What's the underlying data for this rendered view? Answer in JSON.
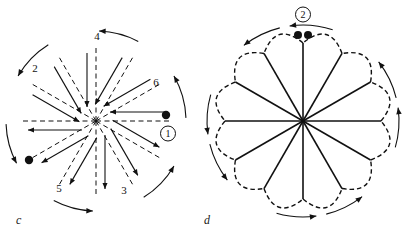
{
  "figure": {
    "panels": [
      {
        "id": "c",
        "label": "c",
        "label_x": 16,
        "label_y": 222,
        "center": {
          "x": 96,
          "y": 121
        },
        "radius": 74,
        "line_style": "dashed",
        "spoke_count": 12,
        "description": "star of twelve dashed radial lines with solid straight arrows alongside each spoke and curved arc arrows around the outside",
        "numeric_labels": [
          {
            "text": "2",
            "x": 35,
            "y": 72
          },
          {
            "text": "4",
            "x": 97,
            "y": 40
          },
          {
            "text": "6",
            "x": 156,
            "y": 86
          },
          {
            "text": "3",
            "x": 124,
            "y": 194
          },
          {
            "text": "5",
            "x": 59,
            "y": 192
          }
        ],
        "circled_labels": [
          {
            "text": "1",
            "x": 168,
            "y": 137
          }
        ],
        "dots": [
          {
            "x": 166,
            "y": 115,
            "r": 4.2,
            "name": "start-dot-right"
          },
          {
            "x": 29,
            "y": 160,
            "r": 4.2,
            "name": "end-dot-lower-left"
          }
        ],
        "spoke_angles_deg": [
          0,
          30,
          60,
          90,
          120,
          150,
          180,
          210,
          240,
          270,
          300,
          330
        ],
        "straight_arrows": [
          {
            "angle_deg": 0,
            "offset": 9,
            "direction": "inward"
          },
          {
            "angle_deg": 30,
            "offset": 9,
            "direction": "inward"
          },
          {
            "angle_deg": 60,
            "offset": 9,
            "direction": "inward"
          },
          {
            "angle_deg": 90,
            "offset": 9,
            "direction": "inward"
          },
          {
            "angle_deg": 120,
            "offset": 9,
            "direction": "inward"
          },
          {
            "angle_deg": 150,
            "offset": 9,
            "direction": "inward"
          },
          {
            "angle_deg": 180,
            "offset": 9,
            "direction": "outward"
          },
          {
            "angle_deg": 210,
            "offset": 9,
            "direction": "outward"
          },
          {
            "angle_deg": 240,
            "offset": 9,
            "direction": "outward"
          },
          {
            "angle_deg": 270,
            "offset": 9,
            "direction": "outward"
          },
          {
            "angle_deg": 300,
            "offset": 9,
            "direction": "outward"
          },
          {
            "angle_deg": 330,
            "offset": 9,
            "direction": "outward"
          }
        ],
        "arc_arrows": [
          {
            "from_deg": 62,
            "to_deg": 88,
            "r": 90,
            "head": "end"
          },
          {
            "from_deg": 122,
            "to_deg": 150,
            "r": 90,
            "head": "end"
          },
          {
            "from_deg": 182,
            "to_deg": 208,
            "r": 90,
            "head": "end"
          },
          {
            "from_deg": 242,
            "to_deg": 268,
            "r": 90,
            "head": "end"
          },
          {
            "from_deg": 302,
            "to_deg": 330,
            "r": 90,
            "head": "end"
          },
          {
            "from_deg": 2,
            "to_deg": 30,
            "r": 90,
            "head": "end"
          }
        ]
      },
      {
        "id": "d",
        "label": "d",
        "label_x": 204,
        "label_y": 222,
        "center": {
          "x": 303,
          "y": 121
        },
        "radius": 78,
        "line_style": "solid",
        "spoke_count": 12,
        "petal_count": 12,
        "petal_style": "dashed",
        "description": "rosette of twelve solid radial lines with twelve dashed petal arcs forming a flower outline and curved arrows around the rim",
        "numeric_labels": [],
        "circled_labels": [
          {
            "text": "2",
            "x": 303,
            "y": 18
          }
        ],
        "dots": [
          {
            "x": 298,
            "y": 35,
            "r": 4.0,
            "name": "pair-dot-left"
          },
          {
            "x": 308,
            "y": 35,
            "r": 4.0,
            "name": "pair-dot-right"
          }
        ],
        "spoke_angles_deg": [
          0,
          30,
          60,
          90,
          120,
          150,
          180,
          210,
          240,
          270,
          300,
          330
        ],
        "arc_arrows": [
          {
            "from_deg": 72,
            "to_deg": 98,
            "r": 96,
            "head": "end"
          },
          {
            "from_deg": 104,
            "to_deg": 128,
            "r": 96,
            "head": "end"
          },
          {
            "from_deg": 164,
            "to_deg": 188,
            "r": 96,
            "head": "end"
          },
          {
            "from_deg": 194,
            "to_deg": 218,
            "r": 96,
            "head": "end"
          },
          {
            "from_deg": 254,
            "to_deg": 278,
            "r": 96,
            "head": "end"
          },
          {
            "from_deg": 284,
            "to_deg": 308,
            "r": 96,
            "head": "end"
          },
          {
            "from_deg": 344,
            "to_deg": 8,
            "r": 96,
            "head": "end"
          },
          {
            "from_deg": 14,
            "to_deg": 38,
            "r": 96,
            "head": "end"
          }
        ]
      }
    ],
    "colors": {
      "ink": "#111111",
      "background": "#ffffff"
    }
  }
}
